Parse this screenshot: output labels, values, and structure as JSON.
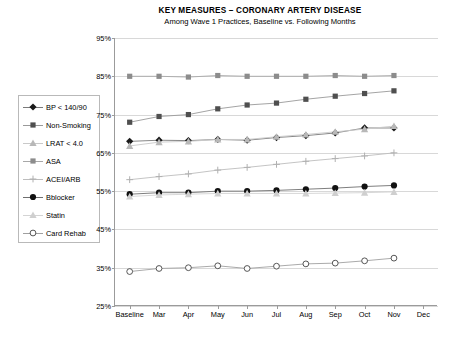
{
  "header": {
    "title": "KEY MEASURES – CORONARY ARTERY DISEASE",
    "subtitle": "Among Wave 1 Practices, Baseline vs. Following Months"
  },
  "legend": {
    "position": "left-outside",
    "items": [
      {
        "label": "BP < 140/90",
        "marker": "diamond",
        "color": "#1a1a1a",
        "line_color": "#7a7a7a"
      },
      {
        "label": "Non-Smoking",
        "marker": "square",
        "color": "#4f4f4f",
        "line_color": "#9a9a9a"
      },
      {
        "label": "LRAT < 4.0",
        "marker": "triangle",
        "color": "#b8b8b8",
        "line_color": "#c9c9c9"
      },
      {
        "label": "ASA",
        "marker": "square",
        "color": "#8c8c8c",
        "line_color": "#a8a8a8"
      },
      {
        "label": "ACEI/ARB",
        "marker": "plus",
        "color": "#b0b0b0",
        "line_color": "#bdbdbd"
      },
      {
        "label": "Bblocker",
        "marker": "circle-filled",
        "color": "#111111",
        "line_color": "#6f6f6f"
      },
      {
        "label": "Statin",
        "marker": "triangle",
        "color": "#cfcfcf",
        "line_color": "#d4d4d4"
      },
      {
        "label": "Card Rehab",
        "marker": "circle-open",
        "color": "#444444",
        "line_color": "#a0a0a0"
      }
    ]
  },
  "chart_data": {
    "type": "line",
    "title": "KEY MEASURES – CORONARY ARTERY DISEASE",
    "subtitle": "Among Wave 1 Practices, Baseline vs. Following Months",
    "xlabel": "",
    "ylabel": "",
    "categories": [
      "Baseline",
      "Mar",
      "Apr",
      "May",
      "Jun",
      "Jul",
      "Aug",
      "Sep",
      "Oct",
      "Nov",
      "Dec"
    ],
    "ylim": [
      25,
      95
    ],
    "yticks": [
      25,
      35,
      45,
      55,
      65,
      75,
      85,
      95
    ],
    "ytick_labels": [
      "25%",
      "35%",
      "45%",
      "55%",
      "65%",
      "75%",
      "85%",
      "95%"
    ],
    "y_units": "percent",
    "grid": true,
    "series": [
      {
        "name": "ASA",
        "values": [
          85.0,
          85.0,
          84.8,
          85.2,
          85.0,
          85.0,
          85.0,
          85.2,
          85.0,
          85.2,
          null
        ]
      },
      {
        "name": "Non-Smoking",
        "values": [
          73.0,
          74.5,
          75.0,
          76.5,
          77.5,
          78.0,
          79.0,
          79.8,
          80.5,
          81.2,
          null
        ]
      },
      {
        "name": "BP < 140/90",
        "values": [
          68.0,
          68.3,
          68.2,
          68.5,
          68.3,
          69.0,
          69.5,
          70.2,
          71.5,
          71.5,
          null
        ]
      },
      {
        "name": "LRAT < 4.0",
        "values": [
          66.8,
          67.8,
          68.0,
          68.5,
          68.5,
          69.2,
          69.8,
          70.5,
          71.2,
          72.0,
          null
        ]
      },
      {
        "name": "ACEI/ARB",
        "values": [
          58.0,
          58.8,
          59.5,
          60.5,
          61.2,
          62.0,
          62.8,
          63.5,
          64.2,
          65.0,
          null
        ]
      },
      {
        "name": "Bblocker",
        "values": [
          54.2,
          54.6,
          54.6,
          55.0,
          55.0,
          55.2,
          55.5,
          55.8,
          56.2,
          56.5,
          null
        ]
      },
      {
        "name": "Statin",
        "values": [
          53.6,
          54.0,
          54.2,
          54.4,
          54.4,
          54.4,
          54.4,
          54.5,
          54.6,
          54.8,
          null
        ]
      },
      {
        "name": "Card Rehab",
        "values": [
          34.0,
          34.8,
          35.0,
          35.5,
          34.8,
          35.4,
          36.0,
          36.2,
          36.8,
          37.5,
          null
        ]
      }
    ]
  }
}
